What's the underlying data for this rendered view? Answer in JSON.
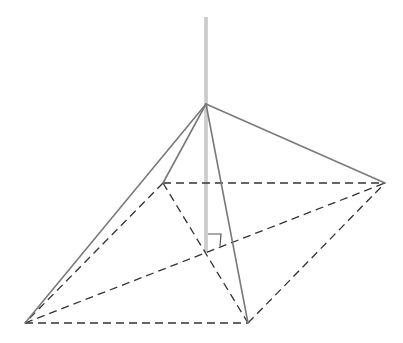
{
  "diagram": {
    "type": "geometry",
    "colors": {
      "background": "#ffffff",
      "solid_edge": "#7a7a7a",
      "dashed_edge": "#333333",
      "height_line": "#b5b5b5",
      "right_angle_mark": "#555555"
    },
    "vertices": {
      "apex": {
        "x": 206,
        "y": 104
      },
      "base_back_left": {
        "x": 163,
        "y": 183
      },
      "base_right": {
        "x": 385,
        "y": 183
      },
      "base_front_left": {
        "x": 25,
        "y": 323
      },
      "base_front_right": {
        "x": 248,
        "y": 323
      },
      "foot": {
        "x": 206,
        "y": 253
      }
    },
    "height_line": {
      "x": 206,
      "y_top": 17,
      "y_bottom": 252
    },
    "solid_edges": [
      {
        "from": "apex",
        "to": "base_front_left"
      },
      {
        "from": "apex",
        "to": "base_back_left"
      },
      {
        "from": "apex",
        "to": "base_front_right"
      },
      {
        "from": "apex",
        "to": "base_right"
      }
    ],
    "dashed_edges": [
      {
        "from": "base_back_left",
        "to": "base_right"
      },
      {
        "from": "base_back_left",
        "to": "base_front_left"
      },
      {
        "from": "base_front_left",
        "to": "base_front_right"
      },
      {
        "from": "base_front_right",
        "to": "base_right"
      },
      {
        "from": "base_back_left",
        "to": "base_front_right"
      },
      {
        "from": "base_front_left",
        "to": "base_right"
      }
    ],
    "right_angle_mark": {
      "x": 208,
      "y": 234,
      "size": 13
    }
  }
}
